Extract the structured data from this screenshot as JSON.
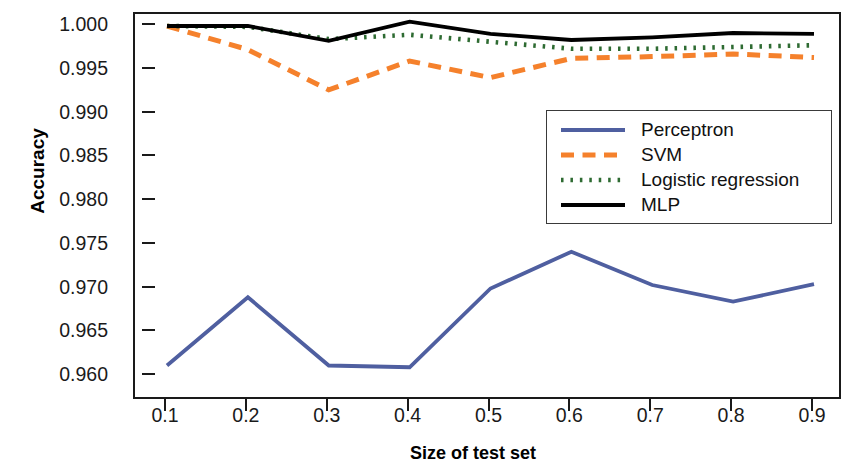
{
  "chart_data": {
    "type": "line",
    "title": "",
    "xlabel": "Size of test set",
    "ylabel": "Accuracy",
    "x": [
      0.1,
      0.2,
      0.3,
      0.4,
      0.5,
      0.6,
      0.7,
      0.8,
      0.9
    ],
    "xtick_labels": [
      "0.1",
      "0.2",
      "0.3",
      "0.4",
      "0.5",
      "0.6",
      "0.7",
      "0.8",
      "0.9"
    ],
    "ytick_labels": [
      "1.000",
      "0.995",
      "0.990",
      "0.985",
      "0.980",
      "0.975",
      "0.970",
      "0.965",
      "0.960"
    ],
    "ytick_values": [
      1.0,
      0.995,
      0.99,
      0.985,
      0.98,
      0.975,
      0.97,
      0.965,
      0.96
    ],
    "xlim": [
      0.06,
      0.94
    ],
    "ylim": [
      0.9585,
      1.0015
    ],
    "grid": false,
    "legend_position": "center-right",
    "series": [
      {
        "name": "Perceptron",
        "color": "#4f5fa0",
        "style": "solid",
        "values": [
          0.9612,
          0.969,
          0.9612,
          0.961,
          0.97,
          0.9742,
          0.9704,
          0.9685,
          0.9705
        ]
      },
      {
        "name": "SVM",
        "color": "#f5812c",
        "style": "dashed",
        "values": [
          1.0,
          0.9973,
          0.9927,
          0.996,
          0.9941,
          0.9963,
          0.9965,
          0.9968,
          0.9964
        ]
      },
      {
        "name": "Logistic regression",
        "color": "#2e6b32",
        "style": "dotted",
        "values": [
          1.0,
          0.9999,
          0.9985,
          0.999,
          0.9982,
          0.9974,
          0.9974,
          0.9976,
          0.9978
        ]
      },
      {
        "name": "MLP",
        "color": "#000000",
        "style": "solid",
        "values": [
          1.0,
          1.0,
          0.9983,
          1.0005,
          0.9991,
          0.9984,
          0.9987,
          0.9992,
          0.9991
        ]
      }
    ]
  },
  "axes": {
    "y_title": "Accuracy",
    "x_title": "Size of test set"
  },
  "legend": {
    "entries": [
      {
        "label": "Perceptron"
      },
      {
        "label": "SVM"
      },
      {
        "label": "Logistic regression"
      },
      {
        "label": "MLP"
      }
    ]
  }
}
